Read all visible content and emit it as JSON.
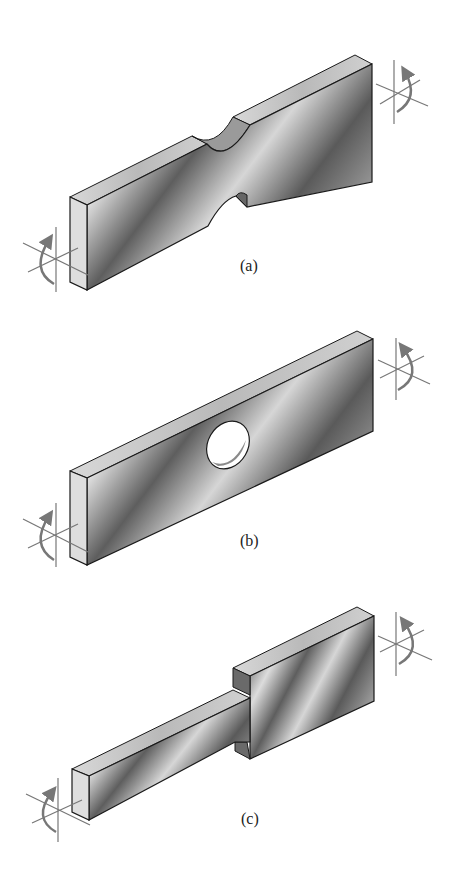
{
  "figure": {
    "panels": [
      {
        "id": "a",
        "label": "(a)",
        "feature": "semicircular notches on top and bottom edges"
      },
      {
        "id": "b",
        "label": "(b)",
        "feature": "central circular hole"
      },
      {
        "id": "c",
        "label": "(c)",
        "feature": "stepped change in width with shoulder"
      }
    ],
    "icons": {
      "moment_symbol": "bending-moment-arrow-icon"
    },
    "colors": {
      "background": "#ffffff",
      "edge": "#1a1a1a",
      "face_dark": "#555555",
      "face_light": "#e8e8e8",
      "side_face": "#d9d9d9",
      "arrow": "#777777"
    }
  }
}
